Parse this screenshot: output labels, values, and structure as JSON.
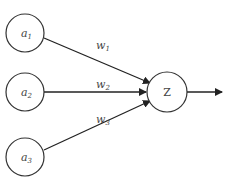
{
  "diagram": {
    "type": "perceptron",
    "inputs": [
      {
        "label": "a",
        "sub": "1"
      },
      {
        "label": "a",
        "sub": "2"
      },
      {
        "label": "a",
        "sub": "3"
      }
    ],
    "weights": [
      {
        "label": "w",
        "sub": "1"
      },
      {
        "label": "w",
        "sub": "2"
      },
      {
        "label": "w",
        "sub": "3"
      }
    ],
    "output_node": {
      "label": "Z"
    },
    "colors": {
      "stroke": "#333333",
      "text": "#444444",
      "background": "#ffffff"
    }
  }
}
